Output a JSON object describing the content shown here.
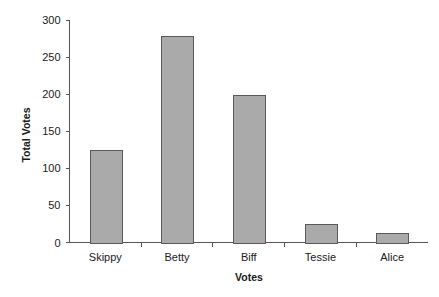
{
  "chart_data": {
    "type": "bar",
    "title": "",
    "subtitle": "",
    "xlabel": "Votes",
    "ylabel": "Total Votes",
    "categories": [
      "Skippy",
      "Betty",
      "Biff",
      "Tessie",
      "Alice"
    ],
    "values": [
      125,
      279,
      199,
      25,
      13
    ],
    "ylim": [
      0,
      300
    ],
    "yticks": [
      0,
      50,
      100,
      150,
      200,
      250,
      300
    ],
    "ytick_labels": [
      "0",
      "50",
      "100",
      "150",
      "200",
      "250",
      "300"
    ],
    "grid": false,
    "legend": false,
    "legend_position": "none",
    "series": [
      {
        "name": "Total Votes",
        "values": [
          125,
          279,
          199,
          25,
          13
        ]
      }
    ],
    "colors": {
      "bar_fill": "#aaaaaa",
      "bar_stroke": "#595959",
      "axis": "#555555",
      "text": "#1a1a1a",
      "background": "#ffffff"
    }
  },
  "axes": {
    "y_axis_title": "Total Votes",
    "x_axis_title": "Votes"
  }
}
